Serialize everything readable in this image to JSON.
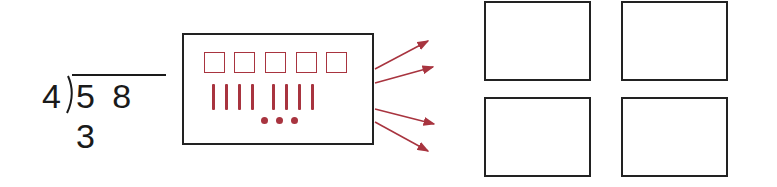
{
  "division_problem": {
    "divisor": "4",
    "dividend": "5 8 3"
  },
  "place_value_model": {
    "hundreds_squares": 5,
    "tens_sticks": 8,
    "ones_dots": 3,
    "model_color": "#a8343f"
  },
  "arrows": {
    "count": 4,
    "color": "#a8343f"
  },
  "groups": {
    "count": 4,
    "labels": [
      "",
      "",
      "",
      ""
    ]
  }
}
